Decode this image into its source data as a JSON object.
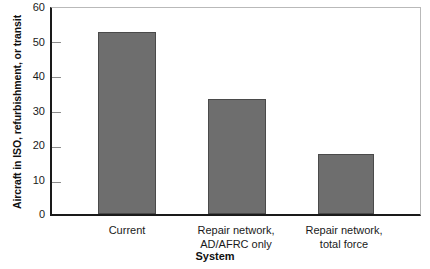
{
  "chart_data": {
    "type": "bar",
    "title": "",
    "xlabel": "System",
    "ylabel": "Aircraft in ISO, refurbishment, or transit",
    "categories": [
      "Current",
      "Repair network,\nAD/AFRC only",
      "Repair network,\ntotal force"
    ],
    "values": [
      53,
      33.5,
      17.5
    ],
    "ylim": [
      0,
      60
    ],
    "yticks": [
      0,
      10,
      20,
      30,
      40,
      50,
      60
    ],
    "ytick_labels": [
      "0",
      "10",
      "20",
      "30",
      "40",
      "50",
      "60"
    ],
    "grid": false,
    "legend": null,
    "series": [
      {
        "name": "Aircraft in ISO, refurbishment, or transit",
        "values": [
          53,
          33.5,
          17.5
        ]
      }
    ],
    "colors": {
      "bar_fill": "#6e6e6e",
      "bar_border": "#4a4a4a",
      "axis": "#1a1a1a",
      "frame": "#b9b9b9",
      "background": "#ffffff",
      "text": "#101010"
    }
  }
}
